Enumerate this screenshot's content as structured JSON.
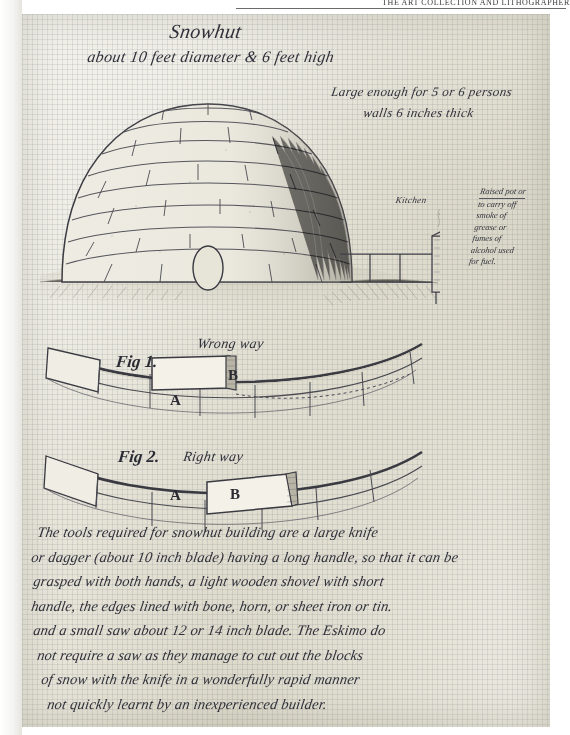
{
  "page": {
    "running_head": "THE ART COLLECTION AND LITHOGRAPHER",
    "paper_tone": "#eceadf",
    "ink_color": "#30303a"
  },
  "drawing": {
    "title": "Snowhut",
    "subtitle": "about 10 feet diameter & 6 feet high",
    "notes": {
      "capacity": "Large enough for 5 or 6 persons",
      "walls": "walls 6 inches thick",
      "kitchen": "Kitchen",
      "chimney_lines": [
        "Raised pot or",
        "to carry off",
        "smoke of",
        "grease or",
        "fumes of",
        "alcohol used",
        "for fuel."
      ]
    }
  },
  "figures": [
    {
      "label": "Fig 1.",
      "caption": "Wrong way",
      "block_a": "A",
      "block_b": "B"
    },
    {
      "label": "Fig 2.",
      "caption": "Right way",
      "block_a": "A",
      "block_b": "B"
    }
  ],
  "paragraph": {
    "lines": [
      "The tools required for snowhut building are a large knife",
      "or dagger (about 10 inch blade) having a long handle, so that it can be",
      "grasped with both hands, a light wooden shovel with short",
      "handle, the edges lined with bone, horn, or sheet iron or tin.",
      "and a small saw about 12 or 14 inch blade. The Eskimo do",
      "not require a saw as they manage to cut out the blocks",
      "of snow with the knife in a wonderfully rapid manner",
      "not quickly learnt by an inexperienced builder."
    ]
  }
}
